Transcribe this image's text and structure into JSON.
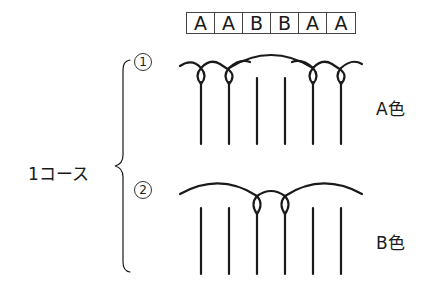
{
  "pattern": {
    "cells": [
      "A",
      "A",
      "B",
      "B",
      "A",
      "A"
    ]
  },
  "course_label": "1コース",
  "steps": [
    {
      "number": "1",
      "color_label": "A色",
      "loop_positions": [
        0,
        1,
        4,
        5
      ],
      "description": "A color yarn loops around stitches 1, 2, 5, 6"
    },
    {
      "number": "2",
      "color_label": "B色",
      "loop_positions": [
        2,
        3
      ],
      "description": "B color yarn loops around stitches 3, 4"
    }
  ],
  "stitch_count": 6,
  "colors": {
    "line": "#1a1a1a",
    "background": "#ffffff"
  }
}
